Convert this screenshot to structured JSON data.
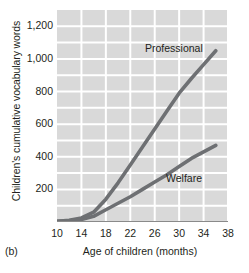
{
  "panel_tag": "(b)",
  "axis": {
    "y_title": "Children's cumulative vocabulary words",
    "x_title": "Age of children (months)"
  },
  "chart_data": {
    "type": "line",
    "title": "",
    "subtitle": "",
    "xlabel": "Age of children (months)",
    "ylabel": "Children's cumulative vocabulary words",
    "xlim": [
      10,
      38
    ],
    "ylim": [
      0,
      1300
    ],
    "xticks": [
      10,
      14,
      18,
      22,
      26,
      30,
      34,
      38
    ],
    "xticklabels": [
      "10",
      "14",
      "18",
      "22",
      "26",
      "30",
      "34",
      "38"
    ],
    "yticks": [
      200,
      400,
      600,
      800,
      1000,
      1200
    ],
    "yticklabels": [
      "200",
      "400",
      "600",
      "800",
      "1,000",
      "1,200"
    ],
    "y_gridline_step": 100,
    "grid": "white gridlines on light gray panel",
    "legend": "inline labels next to each line",
    "plot_background": "#d9d9d9",
    "gridline_color": "#ffffff",
    "line_color": "#6e7073",
    "series": [
      {
        "name": "Professional",
        "label": "Professional",
        "color": "#6e7073",
        "x": [
          10,
          12,
          14,
          16,
          18,
          20,
          22,
          24,
          26,
          28,
          30,
          32,
          34,
          36
        ],
        "values": [
          5,
          10,
          25,
          60,
          140,
          240,
          350,
          460,
          570,
          680,
          790,
          880,
          965,
          1050
        ]
      },
      {
        "name": "Welfare",
        "label": "Welfare",
        "color": "#6e7073",
        "x": [
          10,
          12,
          14,
          16,
          18,
          20,
          22,
          24,
          26,
          28,
          30,
          32,
          34,
          36
        ],
        "values": [
          5,
          8,
          15,
          35,
          75,
          115,
          155,
          200,
          245,
          290,
          340,
          390,
          430,
          470
        ]
      }
    ]
  }
}
